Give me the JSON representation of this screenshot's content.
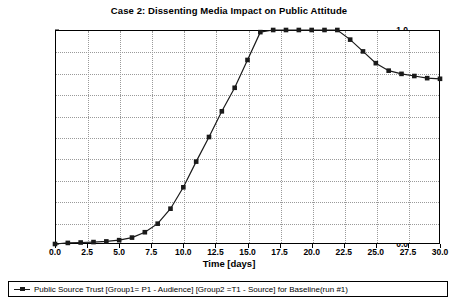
{
  "chart_data": {
    "type": "line",
    "title": "Case 2: Dissenting Media Impact on Public Attitude",
    "xlabel": "Time [days]",
    "ylabel": "Trust",
    "xlim": [
      0.0,
      30.0
    ],
    "ylim": [
      0.0,
      1.0
    ],
    "grid": true,
    "legend_position": "bottom",
    "xticks": [
      "0.0",
      "2.5",
      "5.0",
      "7.5",
      "10.0",
      "12.5",
      "15.0",
      "17.5",
      "20.0",
      "22.5",
      "25.0",
      "27.5",
      "30.0"
    ],
    "xtick_values": [
      0.0,
      2.5,
      5.0,
      7.5,
      10.0,
      12.5,
      15.0,
      17.5,
      20.0,
      22.5,
      25.0,
      27.5,
      30.0
    ],
    "yticks": [
      "0.0",
      "0.1",
      "0.2",
      "0.3",
      "0.4",
      "0.5",
      "0.6",
      "0.7",
      "0.8",
      "0.9",
      "1.0"
    ],
    "ytick_values": [
      0.0,
      0.1,
      0.2,
      0.3,
      0.4,
      0.5,
      0.6,
      0.7,
      0.8,
      0.9,
      1.0
    ],
    "series": [
      {
        "name": "Public Source Trust [Group1= P1 - Audience] [Group2 =T1 - Source] for Baseline(run #1)",
        "color": "#1a1a1a",
        "marker": "square",
        "x": [
          0,
          1,
          2,
          3,
          4,
          5,
          6,
          7,
          8,
          9,
          10,
          11,
          12,
          13,
          14,
          15,
          16,
          17,
          18,
          19,
          20,
          21,
          22,
          23,
          24,
          25,
          26,
          27,
          28,
          29,
          30
        ],
        "values": [
          0.0,
          0.005,
          0.007,
          0.009,
          0.012,
          0.018,
          0.03,
          0.055,
          0.095,
          0.165,
          0.265,
          0.385,
          0.5,
          0.62,
          0.73,
          0.86,
          0.99,
          1.0,
          1.0,
          1.0,
          1.0,
          1.0,
          1.0,
          0.955,
          0.9,
          0.845,
          0.81,
          0.795,
          0.785,
          0.775,
          0.772
        ]
      }
    ]
  },
  "legend": {
    "entries": [
      {
        "label": "Public Source Trust [Group1= P1 - Audience] [Group2 =T1 - Source] for Baseline(run #1)"
      }
    ]
  }
}
